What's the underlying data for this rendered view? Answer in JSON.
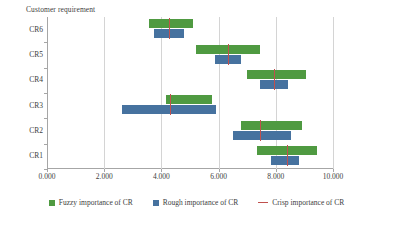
{
  "chart_data": {
    "type": "bar",
    "subtype": "horizontal-floating-range-bar",
    "title": "",
    "ylabel": "Customer requirement",
    "xlabel": "",
    "xlim": [
      0,
      10
    ],
    "xticks": [
      0,
      2,
      4,
      6,
      8,
      10
    ],
    "xtick_labels": [
      "0.000",
      "2.000",
      "4.000",
      "6.000",
      "8.000",
      "10.000"
    ],
    "categories": [
      "CR1",
      "CR2",
      "CR3",
      "CR4",
      "CR5",
      "CR6"
    ],
    "category_order_top_to_bottom": [
      "CR6",
      "CR5",
      "CR4",
      "CR3",
      "CR2",
      "CR1"
    ],
    "grid": "vertical",
    "legend_position": "bottom",
    "series": [
      {
        "name": "Fuzzy importance of CR",
        "type": "range",
        "color": "#4f9a41",
        "ranges": [
          {
            "category": "CR1",
            "low": 7.35,
            "high": 9.45
          },
          {
            "category": "CR2",
            "low": 6.8,
            "high": 8.9
          },
          {
            "category": "CR3",
            "low": 4.15,
            "high": 5.76
          },
          {
            "category": "CR4",
            "low": 7.0,
            "high": 9.07
          },
          {
            "category": "CR5",
            "low": 5.22,
            "high": 7.44
          },
          {
            "category": "CR6",
            "low": 3.56,
            "high": 5.1
          }
        ]
      },
      {
        "name": "Rough importance of CR",
        "type": "range",
        "color": "#46729f",
        "ranges": [
          {
            "category": "CR1",
            "low": 7.82,
            "high": 8.81
          },
          {
            "category": "CR2",
            "low": 6.5,
            "high": 8.54
          },
          {
            "category": "CR3",
            "low": 2.61,
            "high": 5.9
          },
          {
            "category": "CR4",
            "low": 7.44,
            "high": 8.43
          },
          {
            "category": "CR5",
            "low": 5.86,
            "high": 6.79
          },
          {
            "category": "CR6",
            "low": 3.74,
            "high": 4.78
          }
        ]
      },
      {
        "name": "Crisp importance of CR",
        "type": "marker-line",
        "color": "#c0504d",
        "values": [
          {
            "category": "CR1",
            "value": 8.4
          },
          {
            "category": "CR2",
            "value": 7.46
          },
          {
            "category": "CR3",
            "value": 4.3
          },
          {
            "category": "CR4",
            "value": 7.93
          },
          {
            "category": "CR5",
            "value": 6.33
          },
          {
            "category": "CR6",
            "value": 4.27
          }
        ]
      }
    ]
  },
  "legend": {
    "items": [
      {
        "label": "Fuzzy importance of CR",
        "marker": "square",
        "color": "#4f9a41"
      },
      {
        "label": "Rough importance of CR",
        "marker": "square",
        "color": "#46729f"
      },
      {
        "label": "Crisp importance of CR",
        "marker": "line",
        "color": "#c0504d"
      }
    ]
  }
}
